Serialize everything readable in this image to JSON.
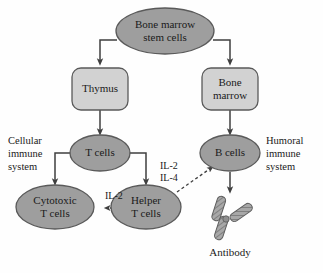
{
  "diagram": {
    "colors": {
      "ellipse_fill": "#9e9e9e",
      "box_fill": "#d2d2d2",
      "stroke": "#4a4a4a",
      "text": "#1a1a1a",
      "background": "#fefefe",
      "antibody_fill": "#a8a8a8"
    },
    "nodes": {
      "stem_cells": {
        "line1": "Bone marrow",
        "line2": "stem cells",
        "shape": "ellipse"
      },
      "thymus": {
        "line1": "Thymus",
        "line2": "",
        "shape": "rounded-rect"
      },
      "bone_marrow": {
        "line1": "Bone",
        "line2": "marrow",
        "shape": "rounded-rect"
      },
      "t_cells": {
        "line1": "T cells",
        "line2": "",
        "shape": "ellipse"
      },
      "b_cells": {
        "line1": "B cells",
        "line2": "",
        "shape": "ellipse"
      },
      "cytotoxic_t_cells": {
        "line1": "Cytotoxic",
        "line2": "T cells",
        "shape": "ellipse"
      },
      "helper_t_cells": {
        "line1": "Helper",
        "line2": "T cells",
        "shape": "ellipse"
      },
      "antibody": {
        "label": "Antibody",
        "shape": "y-glyph"
      }
    },
    "side_labels": {
      "cellular": {
        "line1": "Cellular",
        "line2": "immune",
        "line3": "system"
      },
      "humoral": {
        "line1": "Humoral",
        "line2": "immune",
        "line3": "system"
      }
    },
    "edge_labels": {
      "il2_to_b": "IL-2",
      "il4_to_b": "IL-4",
      "il2_to_cytotoxic": "IL-2"
    }
  }
}
